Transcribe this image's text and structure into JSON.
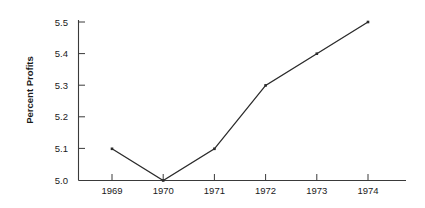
{
  "chart_data": {
    "type": "line",
    "title": "",
    "subtitle": "",
    "xlabel": "",
    "ylabel": "Percent Profits",
    "categories": [
      "1969",
      "1970",
      "1971",
      "1972",
      "1973",
      "1974"
    ],
    "x": [
      1969,
      1970,
      1971,
      1972,
      1973,
      1974
    ],
    "values": [
      5.1,
      5.0,
      5.1,
      5.3,
      5.4,
      5.5
    ],
    "series": [
      {
        "name": "Percent Profits",
        "values": [
          5.1,
          5.0,
          5.1,
          5.3,
          5.4,
          5.5
        ],
        "color": "#2b2b2b",
        "marker": "square"
      }
    ],
    "ylim": [
      5.0,
      5.5
    ],
    "y_ticks": [
      "5.0",
      "5.1",
      "5.2",
      "5.3",
      "5.4",
      "5.5"
    ],
    "y_tick_values": [
      5.0,
      5.1,
      5.2,
      5.3,
      5.4,
      5.5
    ],
    "x_ticks": [
      "1969",
      "1970",
      "1971",
      "1972",
      "1973",
      "1974"
    ],
    "grid": false,
    "legend": false,
    "legend_position": "none",
    "annotations": [],
    "background_color": "#ffffff",
    "axis_color": "#3a3a3a"
  }
}
